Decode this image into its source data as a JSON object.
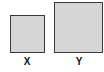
{
  "shapes": [
    {
      "id": "x",
      "label": "X",
      "fill": "#d6d6d6",
      "stroke": "#3a3a3a"
    },
    {
      "id": "y",
      "label": "Y",
      "fill": "#d6d6d6",
      "stroke": "#3a3a3a"
    }
  ]
}
